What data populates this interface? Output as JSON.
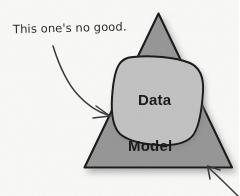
{
  "figure": {
    "background_color": "#fdfdfc",
    "ink_color": "#1b1b1b"
  },
  "annotation": {
    "text": "This one's no good.",
    "style": "handwritten",
    "points_to": "model-triangle-left-edge"
  },
  "shapes": [
    {
      "name": "model-triangle",
      "label": "Model",
      "kind": "triangle",
      "fill_color": "#9a9a9a",
      "stroke_color": "#1b1b1b",
      "has_drop_shadow": true,
      "apex": [
        158,
        13
      ],
      "bottom_left": [
        84,
        168
      ],
      "bottom_right": [
        232,
        168
      ]
    },
    {
      "name": "data-blob",
      "label": "Data",
      "kind": "blob",
      "fill_color": "#c6c6c6",
      "stroke_color": "#1b1b1b",
      "has_drop_shadow": true,
      "bounds": [
        112,
        56,
        205,
        146
      ]
    }
  ],
  "arrows": [
    {
      "name": "annotation-arrow",
      "kind": "curved",
      "from": [
        52,
        46
      ],
      "to": [
        110,
        112
      ],
      "color": "#3a3a3a"
    },
    {
      "name": "corner-arrow",
      "kind": "straight",
      "from": [
        238,
        196
      ],
      "to": [
        207,
        166
      ],
      "color": "#3a3a3a"
    }
  ],
  "labels": {
    "data": "Data",
    "model": "Model"
  }
}
